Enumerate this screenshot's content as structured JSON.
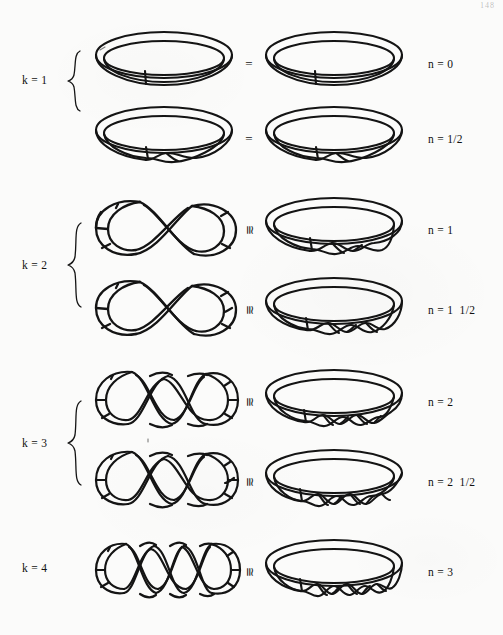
{
  "page": {
    "page_number": "148",
    "background_color": "#fbfbfa",
    "ink_color": "#141414",
    "caption": ""
  },
  "k_groups": [
    {
      "label": "k = 1",
      "k": 1,
      "braced": true,
      "rows": [
        0,
        1
      ]
    },
    {
      "label": "k = 2",
      "k": 2,
      "braced": true,
      "rows": [
        2,
        3
      ]
    },
    {
      "label": "k = 3",
      "k": 3,
      "braced": true,
      "rows": [
        4,
        5
      ]
    },
    {
      "label": "k = 4",
      "k": 4,
      "braced": false,
      "rows": [
        6
      ]
    }
  ],
  "rows": [
    {
      "id": "row-n-0",
      "k": 1,
      "relation": "=",
      "relation_rotated": false,
      "n_label": "n = 0",
      "left_figure": "band-1-loop-untwisted",
      "right_figure": "ring-0-twists",
      "left_loops": 1,
      "right_half_twists": 0
    },
    {
      "id": "row-n-1-2",
      "k": 1,
      "relation": "=",
      "relation_rotated": false,
      "n_label": "n = 1/2",
      "left_figure": "band-1-loop-half-twist",
      "right_figure": "ring-1-half-twist",
      "left_loops": 1,
      "right_half_twists": 1
    },
    {
      "id": "row-n-1",
      "k": 2,
      "relation": "≅",
      "relation_rotated": true,
      "n_label": "n = 1",
      "left_figure": "band-2-loop-figure-eight",
      "right_figure": "ring-1-full-twist",
      "left_loops": 2,
      "right_half_twists": 2
    },
    {
      "id": "row-n-1-1-2",
      "k": 2,
      "relation": "≅",
      "relation_rotated": true,
      "n_label": "n = 1  1/2",
      "left_figure": "band-2-loop-figure-eight-half-twist",
      "right_figure": "ring-3-half-twists",
      "left_loops": 2,
      "right_half_twists": 3
    },
    {
      "id": "row-n-2",
      "k": 3,
      "relation": "≅",
      "relation_rotated": true,
      "n_label": "n = 2",
      "left_figure": "band-3-loop-braid",
      "right_figure": "ring-2-full-twists",
      "left_loops": 3,
      "right_half_twists": 4
    },
    {
      "id": "row-n-2-1-2",
      "k": 3,
      "relation": "≅",
      "relation_rotated": true,
      "n_label": "n = 2  1/2",
      "left_figure": "band-3-loop-braid-half-twist",
      "right_figure": "ring-5-half-twists",
      "left_loops": 3,
      "right_half_twists": 5
    },
    {
      "id": "row-n-3",
      "k": 4,
      "relation": "≅",
      "relation_rotated": true,
      "n_label": "n = 3",
      "left_figure": "band-4-loop-braid",
      "right_figure": "ring-3-full-twists",
      "left_loops": 4,
      "right_half_twists": 6
    }
  ]
}
